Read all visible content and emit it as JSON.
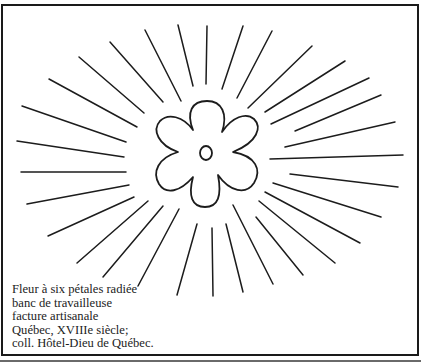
{
  "figure": {
    "subject": "Fleur à six pétales radiée",
    "colors": {
      "ink": "#1c1c1c",
      "background": "#ffffff"
    },
    "flower": {
      "petals": 6,
      "center": [
        206,
        154
      ]
    },
    "ray_count": 36
  },
  "caption": {
    "lines": [
      "Fleur à six pétales radiée",
      "banc de travailleuse",
      "facture artisanale",
      "Québec, XVIIIe siècle;",
      "coll. Hôtel-Dieu de Québec."
    ]
  }
}
